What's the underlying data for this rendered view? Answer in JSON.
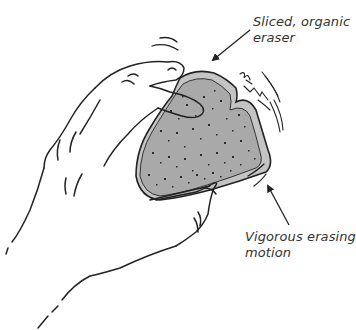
{
  "figure": {
    "colors": {
      "background": "#ffffff",
      "line": "#222222",
      "eraser_fill": "#a9a9a9",
      "eraser_edge": "#c4c4c4",
      "speckle": "#2a2a2a",
      "label_text": "#333333"
    }
  },
  "annotations": [
    {
      "id": "eraser",
      "lines": [
        "Sliced, organic",
        "eraser"
      ]
    },
    {
      "id": "motion",
      "lines": [
        "Vigorous erasing",
        "motion"
      ]
    }
  ]
}
